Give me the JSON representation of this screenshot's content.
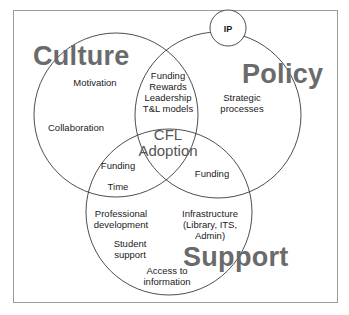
{
  "diagram": {
    "type": "venn",
    "sets": {
      "culture": {
        "label": "Culture"
      },
      "policy": {
        "label": "Policy"
      },
      "support": {
        "label": "Support"
      }
    },
    "center": {
      "line1": "CFL",
      "line2": "Adoption"
    },
    "ip": {
      "label": "IP"
    },
    "regions": {
      "culture_only": {
        "motivation": "Motivation",
        "collaboration": "Collaboration"
      },
      "policy_only": {
        "line1": "Strategic",
        "line2": "processes"
      },
      "culture_policy": {
        "line1": "Funding",
        "line2": "Rewards",
        "line3": "Leadership",
        "line4": "T&L models"
      },
      "culture_support": {
        "funding": "Funding",
        "time": "Time"
      },
      "policy_support": {
        "funding": "Funding"
      },
      "support_only": {
        "professional_line1": "Professional",
        "professional_line2": "development",
        "student_line1": "Student",
        "student_line2": "support",
        "access_line1": "Access to",
        "access_line2": "information",
        "infra_line1": "Infrastructure",
        "infra_line2": "(Library, ITS,",
        "infra_line3": "Admin)"
      }
    },
    "colors": {
      "line": "#3a3a3a",
      "big_label": "#6a6a6a",
      "text": "#1a1a1a",
      "frame": "#9a9a9a"
    }
  }
}
